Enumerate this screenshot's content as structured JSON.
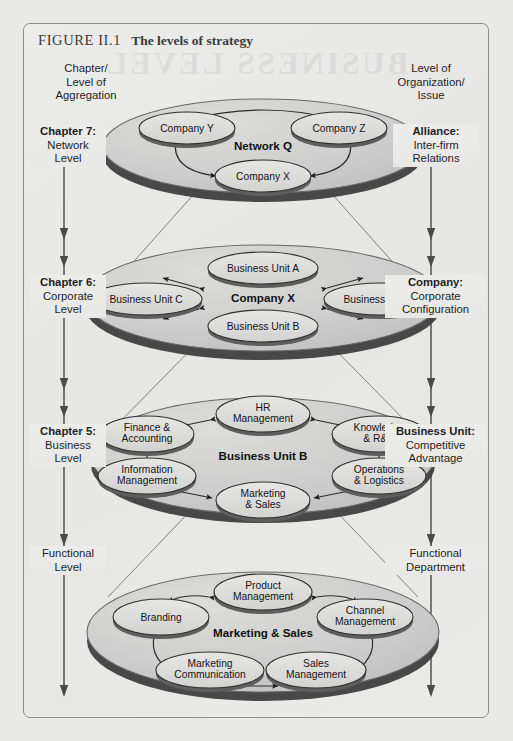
{
  "figure": {
    "number": "FIGURE II.1",
    "caption": "The levels of strategy",
    "watermark": "BUSINESS LEVEL"
  },
  "columns": {
    "left_header": "Chapter/\nLevel of\nAggregation",
    "left_header_line1": "Chapter/",
    "left_header_line2": "Level of",
    "left_header_line3": "Aggregation",
    "right_header_line1": "Level of",
    "right_header_line2": "Organization/",
    "right_header_line3": "Issue"
  },
  "levels": [
    {
      "id": "network",
      "left_label": {
        "bold": "Chapter 7:",
        "line2": "Network",
        "line3": "Level"
      },
      "right_label": {
        "bold": "Alliance:",
        "line2": "Inter-firm",
        "line3": "Relations"
      },
      "disc_label": "Network Q",
      "nodes": [
        {
          "id": "company-y",
          "label": "Company Y"
        },
        {
          "id": "company-z",
          "label": "Company Z"
        },
        {
          "id": "company-x",
          "label": "Company X"
        }
      ]
    },
    {
      "id": "corporate",
      "left_label": {
        "bold": "Chapter 6:",
        "line2": "Corporate",
        "line3": "Level"
      },
      "right_label": {
        "bold": "Company:",
        "line2": "Corporate",
        "line3": "Configuration"
      },
      "disc_label": "Company X",
      "nodes": [
        {
          "id": "business-unit-a",
          "label": "Business Unit A"
        },
        {
          "id": "business-unit-c",
          "label": "Business Unit C"
        },
        {
          "id": "business-unit-d",
          "label": "Business Unit D"
        },
        {
          "id": "business-unit-b",
          "label": "Business Unit B"
        }
      ]
    },
    {
      "id": "business",
      "left_label": {
        "bold": "Chapter 5:",
        "line2": "Business",
        "line3": "Level"
      },
      "right_label": {
        "bold": "Business Unit:",
        "line2": "Competitive",
        "line3": "Advantage"
      },
      "disc_label": "Business Unit B",
      "nodes": [
        {
          "id": "hr-management",
          "line1": "HR",
          "line2": "Management"
        },
        {
          "id": "finance-accounting",
          "line1": "Finance &",
          "line2": "Accounting"
        },
        {
          "id": "knowledge-rd",
          "line1": "Knowledge",
          "line2": "& R&D"
        },
        {
          "id": "information-management",
          "line1": "Information",
          "line2": "Management"
        },
        {
          "id": "operations-logistics",
          "line1": "Operations",
          "line2": "& Logistics"
        },
        {
          "id": "marketing-sales",
          "line1": "Marketing",
          "line2": "& Sales"
        }
      ]
    },
    {
      "id": "functional",
      "left_label": {
        "bold": "",
        "line2": "Functional",
        "line3": "Level"
      },
      "right_label": {
        "bold": "",
        "line2": "Functional",
        "line3": "Department"
      },
      "disc_label": "Marketing & Sales",
      "nodes": [
        {
          "id": "product-management",
          "line1": "Product",
          "line2": "Management"
        },
        {
          "id": "branding",
          "line1": "Branding",
          "line2": ""
        },
        {
          "id": "channel-management",
          "line1": "Channel",
          "line2": "Management"
        },
        {
          "id": "marketing-communication",
          "line1": "Marketing",
          "line2": "Communication"
        },
        {
          "id": "sales-management",
          "line1": "Sales",
          "line2": "Management"
        }
      ]
    }
  ],
  "colors": {
    "page_bg": "#e9e9e7",
    "frame_border": "#8d8d8f",
    "disc_top": "#cfcfcd",
    "disc_edge": "#4f4f4f",
    "node_fill": "#dedede",
    "node_shadow": "#6e6e6e",
    "stroke": "#2b2b2b"
  }
}
